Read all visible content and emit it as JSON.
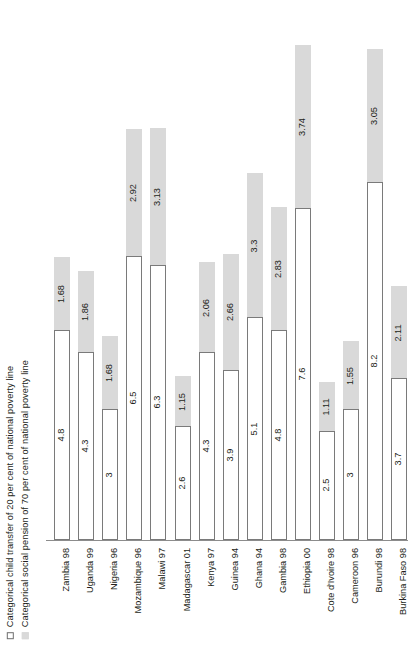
{
  "chart_data": {
    "type": "bar",
    "title": "",
    "xlabel": "",
    "ylabel": "",
    "stacked": true,
    "grid": false,
    "legend_position": "left-rotated",
    "ylim": [
      0,
      12
    ],
    "categories": [
      "Zambia 98",
      "Uganda 99",
      "Nigeria 96",
      "Mozambique 96",
      "Malawi 97",
      "Madagascar 01",
      "Kenya 97",
      "Guinea 94",
      "Ghana 94",
      "Gambia 98",
      "Ethiopia 00",
      "Cote d'Ivoire 98",
      "Cameroon 96",
      "Burundi 98",
      "Burkina Faso 98"
    ],
    "series": [
      {
        "name": "Categorical child transfer of 20 per cent of national poverty line",
        "color": "#ffffff",
        "values": [
          4.8,
          4.3,
          3,
          6.5,
          6.3,
          2.6,
          4.3,
          3.9,
          5.1,
          4.8,
          7.6,
          2.5,
          3,
          8.2,
          3.7
        ],
        "labels": [
          "4.8",
          "4.3",
          "3",
          "6.5",
          "6.3",
          "2.6",
          "4.3",
          "3.9",
          "5.1",
          "4.8",
          "7.6",
          "2.5",
          "3",
          "8.2",
          "3.7"
        ]
      },
      {
        "name": "Categorical social pension of 70 per cent of national poverty line",
        "color": "#d9d9d9",
        "values": [
          1.68,
          1.86,
          1.68,
          2.92,
          3.13,
          1.15,
          2.06,
          2.66,
          3.3,
          2.83,
          3.74,
          1.11,
          1.55,
          3.05,
          2.11
        ],
        "labels": [
          "1.68",
          "1.86",
          "1.68",
          "2.92",
          "3.13",
          "1.15",
          "2.06",
          "2.66",
          "3.3",
          "2.83",
          "3.74",
          "1.11",
          "1.55",
          "3.05",
          "2.11"
        ]
      }
    ]
  },
  "legend": {
    "items": [
      {
        "swatch": "white",
        "label": "Categorical child transfer of 20 per cent of national poverty line"
      },
      {
        "swatch": "gray",
        "label": "Categorical social pension of 70 per cent of national poverty line"
      }
    ]
  },
  "colors": {
    "series_child_transfer": "#ffffff",
    "series_social_pension": "#d9d9d9",
    "axis": "#8c8c8c",
    "text": "#231f20"
  }
}
